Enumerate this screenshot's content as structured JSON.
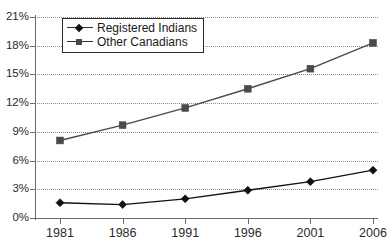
{
  "chart_data": {
    "type": "line",
    "title": "",
    "xlabel": "",
    "ylabel": "",
    "x": [
      "1981",
      "1986",
      "1991",
      "1996",
      "2001",
      "2006"
    ],
    "categories": [
      "1981",
      "1986",
      "1991",
      "1996",
      "2001",
      "2006"
    ],
    "series": [
      {
        "name": "Registered Indians",
        "marker": "diamond",
        "color": "#111111",
        "values": [
          1.6,
          1.4,
          2.0,
          2.9,
          3.8,
          5.0
        ]
      },
      {
        "name": "Other Canadians",
        "marker": "square",
        "color": "#4a4a4a",
        "values": [
          8.1,
          9.7,
          11.5,
          13.5,
          15.6,
          18.3
        ]
      }
    ],
    "ylim": [
      0,
      21
    ],
    "ytick_values": [
      0,
      3,
      6,
      9,
      12,
      15,
      18,
      21
    ],
    "ytick_labels": [
      "0%",
      "3%",
      "6%",
      "9%",
      "12%",
      "15%",
      "18%",
      "21%"
    ],
    "xtick_labels": [
      "1981",
      "1986",
      "1991",
      "1996",
      "2001",
      "2006"
    ],
    "grid": "horizontal-dotted",
    "legend_position": "upper-left-inside"
  },
  "legend": {
    "items": [
      {
        "label": "Registered Indians"
      },
      {
        "label": "Other Canadians"
      }
    ]
  },
  "axes": {
    "y_labels": [
      "21%",
      "18%",
      "15%",
      "12%",
      "9%",
      "6%",
      "3%",
      "0%"
    ],
    "x_labels": [
      "1981",
      "1986",
      "1991",
      "1996",
      "2001",
      "2006"
    ]
  },
  "colors": {
    "series_registered_indians": "#111111",
    "series_other_canadians": "#4a4a4a",
    "gridline": "#8a8a8a",
    "axis": "#6b6b6b",
    "text": "#2b2b2b"
  }
}
